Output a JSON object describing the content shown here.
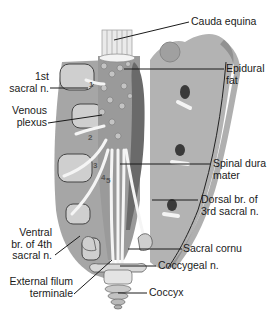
{
  "figure": {
    "colors": {
      "bone_dark": "#8c8c8c",
      "bone_mid": "#a9a9a9",
      "bone_light": "#cfcfcf",
      "nerve": "#f2f2f2",
      "dura": "#6e6e6e",
      "line": "#1a1a1a",
      "background": "#ffffff"
    }
  },
  "labels": {
    "cauda_equina": "Cauda equina",
    "epidural_fat_1": "Epidural",
    "epidural_fat_2": "fat",
    "first_sacral_1": "1st",
    "first_sacral_2": "sacral n.",
    "venous_plexus_1": "Venous",
    "venous_plexus_2": "plexus",
    "spinal_dura_1": "Spinal dura",
    "spinal_dura_2": "mater",
    "dorsal_br_1": "Dorsal br. of",
    "dorsal_br_2": "3rd sacral n.",
    "ventral_br_1": "Ventral",
    "ventral_br_2": "br. of 4th",
    "ventral_br_3": "sacral n.",
    "sacral_cornu": "Sacral cornu",
    "coccygeal_n": "Coccygeal n.",
    "external_filum_1": "External filum",
    "external_filum_2": "terminale",
    "coccyx": "Coccyx"
  },
  "numbers": [
    "1",
    "2",
    "3",
    "4",
    "5"
  ]
}
